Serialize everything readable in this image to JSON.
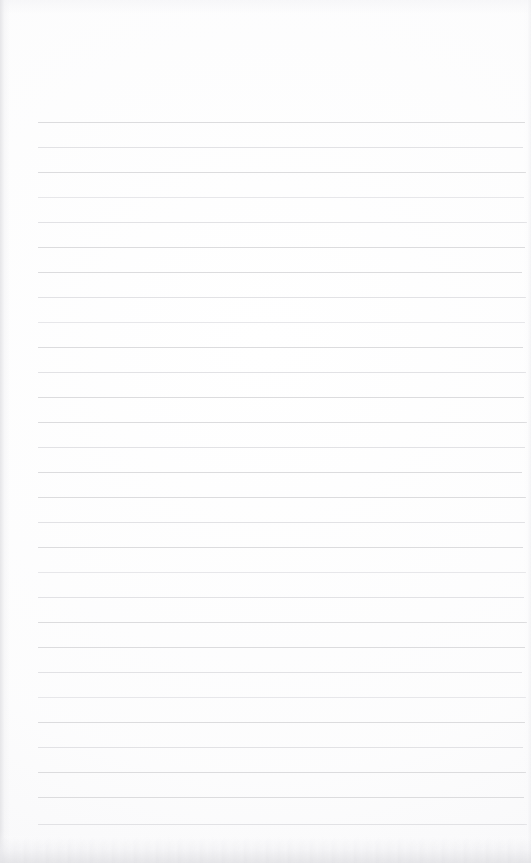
{
  "page": {
    "kind": "blank-lined-notebook-page",
    "width": 531,
    "height": 863,
    "background_color": "#ffffff",
    "has_visible_text": false,
    "text_content": ""
  },
  "header_margin": {
    "label": "",
    "top": 0,
    "height": 122,
    "note": ""
  },
  "ruled_area": {
    "line_color": "#dcdcde",
    "line_thickness_px": 1,
    "line_left_x": 38,
    "line_right_x": 525,
    "first_line_y": 122,
    "line_spacing_px": 25,
    "line_count": 29,
    "line_y_positions": [
      122,
      147,
      172,
      197,
      222,
      247,
      272,
      297,
      322,
      347,
      372,
      397,
      422,
      447,
      472,
      497,
      522,
      547,
      572,
      597,
      622,
      647,
      672,
      697,
      722,
      747,
      772,
      797,
      824
    ],
    "line_labels": [
      "",
      "",
      "",
      "",
      "",
      "",
      "",
      "",
      "",
      "",
      "",
      "",
      "",
      "",
      "",
      "",
      "",
      "",
      "",
      "",
      "",
      "",
      "",
      "",
      "",
      "",
      "",
      "",
      ""
    ]
  },
  "edge_effects": {
    "left_shadow_color": "#e2e2e5",
    "right_shadow_color": "#ebebee",
    "bottom_shadow_color": "#e4e4e7",
    "top_shadow_color": "#f3f3f6"
  }
}
